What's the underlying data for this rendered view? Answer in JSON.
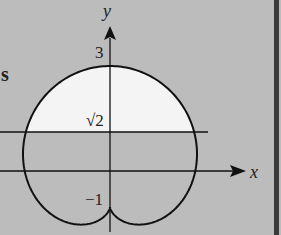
{
  "figure": {
    "side_label": "s",
    "axis_labels": {
      "x": "x",
      "y": "y"
    },
    "tick_labels": {
      "top": "3",
      "line": "√2",
      "bottom": "−1"
    },
    "curve": {
      "type": "cardioid",
      "equation_hint": "r = 2(1 + sinθ), cusp at (0, −1)",
      "top_y": 3,
      "cusp_y": -1
    },
    "horizontal_line": {
      "y_label": "√2"
    },
    "colors": {
      "background": "#bcbcbc",
      "region_fill": "#f4f4f4",
      "stroke": "#111111",
      "border": "#3a3a3a"
    }
  }
}
